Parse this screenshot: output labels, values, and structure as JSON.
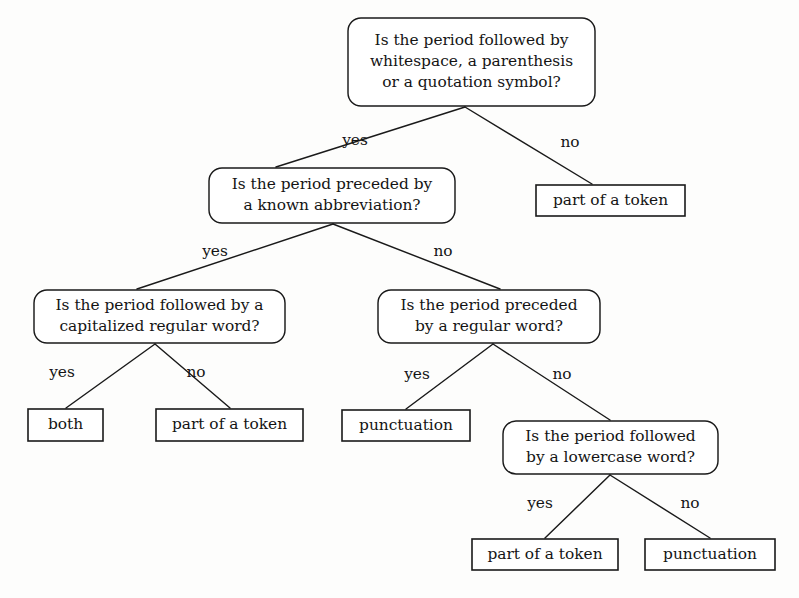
{
  "diagram": {
    "type": "decision-tree",
    "colors": {
      "background": "#fdfdfc",
      "stroke": "#1a1a1a",
      "text": "#141414",
      "node_fill": "#ffffff"
    },
    "nodes": [
      {
        "id": "q-root",
        "shape": "rounded-rect",
        "kind": "question",
        "lines": [
          "Is the period followed by",
          "whitespace, a parenthesis",
          "or a quotation symbol?"
        ],
        "x": 348,
        "y": 18,
        "w": 247,
        "h": 88
      },
      {
        "id": "q-abbrev",
        "shape": "rounded-rect",
        "kind": "question",
        "lines": [
          "Is the period preceded by",
          "a known abbreviation?"
        ],
        "x": 209,
        "y": 168,
        "w": 246,
        "h": 55
      },
      {
        "id": "leaf-token-1",
        "shape": "rect",
        "kind": "outcome",
        "lines": [
          "part of a token"
        ],
        "x": 536,
        "y": 185,
        "w": 149,
        "h": 31
      },
      {
        "id": "q-capitalized",
        "shape": "rounded-rect",
        "kind": "question",
        "lines": [
          "Is the period followed by a",
          "capitalized regular word?"
        ],
        "x": 34,
        "y": 290,
        "w": 251,
        "h": 53
      },
      {
        "id": "q-regular-word",
        "shape": "rounded-rect",
        "kind": "question",
        "lines": [
          "Is the period preceded",
          "by a regular word?"
        ],
        "x": 378,
        "y": 290,
        "w": 222,
        "h": 53
      },
      {
        "id": "leaf-both",
        "shape": "rect",
        "kind": "outcome",
        "lines": [
          "both"
        ],
        "x": 28,
        "y": 409,
        "w": 75,
        "h": 32
      },
      {
        "id": "leaf-token-2",
        "shape": "rect",
        "kind": "outcome",
        "lines": [
          "part of a token"
        ],
        "x": 156,
        "y": 409,
        "w": 147,
        "h": 32
      },
      {
        "id": "leaf-punct-1",
        "shape": "rect",
        "kind": "outcome",
        "lines": [
          "punctuation"
        ],
        "x": 342,
        "y": 410,
        "w": 128,
        "h": 31
      },
      {
        "id": "q-lowercase",
        "shape": "rounded-rect",
        "kind": "question",
        "lines": [
          "Is the period followed",
          "by a lowercase word?"
        ],
        "x": 503,
        "y": 421,
        "w": 215,
        "h": 53
      },
      {
        "id": "leaf-token-3",
        "shape": "rect",
        "kind": "outcome",
        "lines": [
          "part of a token"
        ],
        "x": 472,
        "y": 539,
        "w": 146,
        "h": 31
      },
      {
        "id": "leaf-punct-2",
        "shape": "rect",
        "kind": "outcome",
        "lines": [
          "punctuation"
        ],
        "x": 645,
        "y": 539,
        "w": 130,
        "h": 31
      }
    ],
    "edges": [
      {
        "id": "edge-root-yes",
        "from": "q-root",
        "to": "q-abbrev",
        "label": "yes",
        "x1": 465,
        "y1": 107,
        "x2": 276,
        "y2": 167,
        "lx": 355,
        "ly": 141
      },
      {
        "id": "edge-root-no",
        "from": "q-root",
        "to": "leaf-token-1",
        "label": "no",
        "x1": 465,
        "y1": 107,
        "x2": 592,
        "y2": 184,
        "lx": 570,
        "ly": 143
      },
      {
        "id": "edge-abbrev-yes",
        "from": "q-abbrev",
        "to": "q-capitalized",
        "label": "yes",
        "x1": 333,
        "y1": 224,
        "x2": 137,
        "y2": 289,
        "lx": 215,
        "ly": 252
      },
      {
        "id": "edge-abbrev-no",
        "from": "q-abbrev",
        "to": "q-regular-word",
        "label": "no",
        "x1": 333,
        "y1": 224,
        "x2": 500,
        "y2": 289,
        "lx": 443,
        "ly": 252
      },
      {
        "id": "edge-capitalized-yes",
        "from": "q-capitalized",
        "to": "leaf-both",
        "label": "yes",
        "x1": 155,
        "y1": 344,
        "x2": 66,
        "y2": 408,
        "lx": 62,
        "ly": 373
      },
      {
        "id": "edge-capitalized-no",
        "from": "q-capitalized",
        "to": "leaf-token-2",
        "label": "no",
        "x1": 155,
        "y1": 344,
        "x2": 230,
        "y2": 408,
        "lx": 196,
        "ly": 373
      },
      {
        "id": "edge-regular-yes",
        "from": "q-regular-word",
        "to": "leaf-punct-1",
        "label": "yes",
        "x1": 493,
        "y1": 344,
        "x2": 406,
        "y2": 409,
        "lx": 417,
        "ly": 375
      },
      {
        "id": "edge-regular-no",
        "from": "q-regular-word",
        "to": "q-lowercase",
        "label": "no",
        "x1": 493,
        "y1": 344,
        "x2": 610,
        "y2": 420,
        "lx": 562,
        "ly": 375
      },
      {
        "id": "edge-lowercase-yes",
        "from": "q-lowercase",
        "to": "leaf-token-3",
        "label": "yes",
        "x1": 610,
        "y1": 475,
        "x2": 545,
        "y2": 538,
        "lx": 540,
        "ly": 504
      },
      {
        "id": "edge-lowercase-no",
        "from": "q-lowercase",
        "to": "leaf-punct-2",
        "label": "no",
        "x1": 610,
        "y1": 475,
        "x2": 710,
        "y2": 538,
        "lx": 690,
        "ly": 504
      }
    ]
  }
}
